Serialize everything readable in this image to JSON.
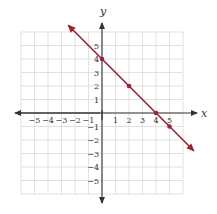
{
  "chart_data": {
    "type": "line",
    "title": "",
    "xlabel": "x",
    "ylabel": "y",
    "xlim": [
      -6,
      6
    ],
    "ylim": [
      -6,
      6
    ],
    "grid": true,
    "x_ticks": [
      -5,
      -4,
      -3,
      -2,
      -1,
      1,
      2,
      3,
      4,
      5
    ],
    "y_ticks": [
      -5,
      -4,
      -3,
      -2,
      -1,
      1,
      2,
      3,
      4,
      5
    ],
    "x_tick_labels": [
      "−5",
      "−4",
      "−3",
      "−2",
      "−1",
      "1",
      "2",
      "3",
      "4",
      "5"
    ],
    "y_tick_labels": [
      "−5",
      "−4",
      "−3",
      "−2",
      "−1",
      "1",
      "2",
      "3",
      "4",
      "5"
    ],
    "series": [
      {
        "name": "line",
        "equation": "y = -x + 4",
        "slope": -1,
        "intercept": 4,
        "x_range": [
          -2.5,
          6.8
        ],
        "color": "#9b2335",
        "arrows_both_ends": true,
        "points": [
          {
            "x": 0,
            "y": 4
          },
          {
            "x": 2,
            "y": 2
          },
          {
            "x": 4,
            "y": 0
          },
          {
            "x": 5,
            "y": -1
          }
        ]
      }
    ],
    "legend": null
  },
  "style": {
    "grid_color": "#d9d9d9",
    "axis_color": "#333333",
    "line_color": "#9b2335"
  },
  "labels": {
    "x_axis": "x",
    "y_axis": "y"
  }
}
